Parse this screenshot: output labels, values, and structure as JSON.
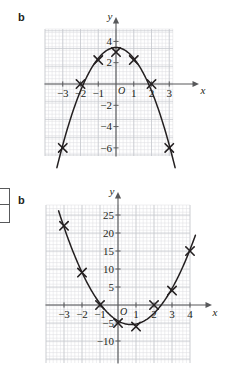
{
  "panels": [
    {
      "part_label": "b",
      "axis": {
        "x_label": "x",
        "y_label": "y",
        "origin_label": "O"
      }
    },
    {
      "part_label": "b",
      "axis": {
        "x_label": "x",
        "y_label": "y",
        "origin_label": "O"
      }
    }
  ],
  "side_box": {
    "name": "cropped-answer-box"
  },
  "colors": {
    "curve": "#231f20",
    "axis": "#58595b",
    "grid_minor": "#dcdde1",
    "grid_major": "#c3c5cc",
    "text": "#231f20"
  },
  "chart_data": [
    {
      "type": "scatter",
      "title": "",
      "xlabel": "x",
      "ylabel": "y",
      "xlim": [
        -3.8,
        3.8
      ],
      "ylim": [
        -7.6,
        4.6
      ],
      "grid": true,
      "legend": false,
      "x_ticks": [
        -3,
        -2,
        -1,
        1,
        2,
        3
      ],
      "x_tick_labels": [
        "−3",
        "−2",
        "−1",
        "1",
        "2",
        "3"
      ],
      "y_ticks": [
        -6,
        -4,
        -2,
        2,
        4
      ],
      "y_tick_labels": [
        "−6",
        "−4",
        "−2",
        "2",
        "4"
      ],
      "origin_label": "O",
      "x": [
        -3,
        -2,
        -1,
        0,
        1,
        2,
        3
      ],
      "y": [
        -6,
        0,
        2.25,
        3,
        2.25,
        0,
        -6
      ],
      "marker": "x",
      "curve": "smooth-parabola-downward"
    },
    {
      "type": "scatter",
      "title": "",
      "xlabel": "x",
      "ylabel": "y",
      "xlim": [
        -3.9,
        4.9
      ],
      "ylim": [
        -13,
        28
      ],
      "grid": true,
      "legend": false,
      "x_ticks": [
        -3,
        -2,
        -1,
        1,
        2,
        3,
        4
      ],
      "x_tick_labels": [
        "−3",
        "−2",
        "−1",
        "1",
        "2",
        "3",
        "4"
      ],
      "y_ticks": [
        -10,
        -5,
        5,
        10,
        15,
        20,
        25
      ],
      "y_tick_labels": [
        "−10",
        "−5",
        "5",
        "10",
        "15",
        "20",
        "25"
      ],
      "origin_label": "O",
      "x": [
        -3,
        -2,
        -1,
        0,
        1,
        2,
        3,
        4
      ],
      "y": [
        22,
        9,
        0,
        -5,
        -6,
        0,
        4,
        15
      ],
      "marker": "x",
      "curve": "smooth-parabola-upward"
    }
  ]
}
